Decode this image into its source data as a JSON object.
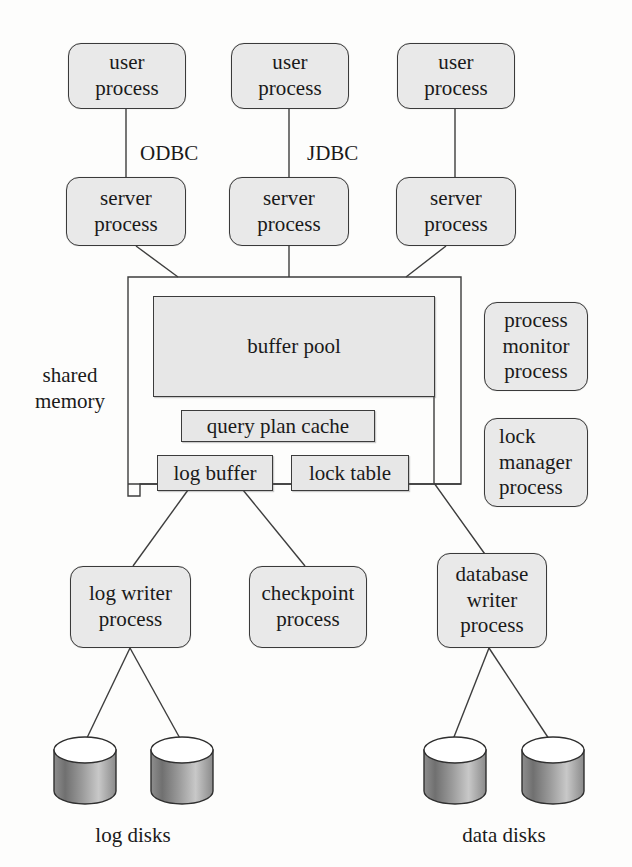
{
  "figure": {
    "background_color": "#fdfdfc",
    "line_color": "#3d3d3d",
    "box_fill": "#e9e9e9",
    "memory_box_fill": "#e7e7e7"
  },
  "user_processes": [
    {
      "line1": "user",
      "line2": "process"
    },
    {
      "line1": "user",
      "line2": "process"
    },
    {
      "line1": "user",
      "line2": "process"
    }
  ],
  "connection_labels": [
    {
      "text": "ODBC"
    },
    {
      "text": "JDBC"
    }
  ],
  "server_processes": [
    {
      "line1": "server",
      "line2": "process"
    },
    {
      "line1": "server",
      "line2": "process"
    },
    {
      "line1": "server",
      "line2": "process"
    }
  ],
  "shared_memory": {
    "label_line1": "shared",
    "label_line2": "memory",
    "structures": [
      {
        "name": "buffer-pool",
        "label": "buffer pool"
      },
      {
        "name": "query-plan-cache",
        "label": "query plan cache"
      },
      {
        "name": "log-buffer",
        "label": "log buffer"
      },
      {
        "name": "lock-table",
        "label": "lock table"
      }
    ]
  },
  "side_processes": [
    {
      "line1": "process",
      "line2": "monitor",
      "line3": "process",
      "align": "center"
    },
    {
      "line1": "lock",
      "line2": "manager",
      "line3": "process",
      "align": "left"
    }
  ],
  "writer_processes": [
    {
      "line1": "log writer",
      "line2": "process"
    },
    {
      "line1": "checkpoint",
      "line2": "process"
    },
    {
      "line1": "database",
      "line2": "writer",
      "line3": "process"
    }
  ],
  "disk_groups": [
    {
      "label": "log disks",
      "count": 2
    },
    {
      "label": "data disks",
      "count": 2
    }
  ]
}
